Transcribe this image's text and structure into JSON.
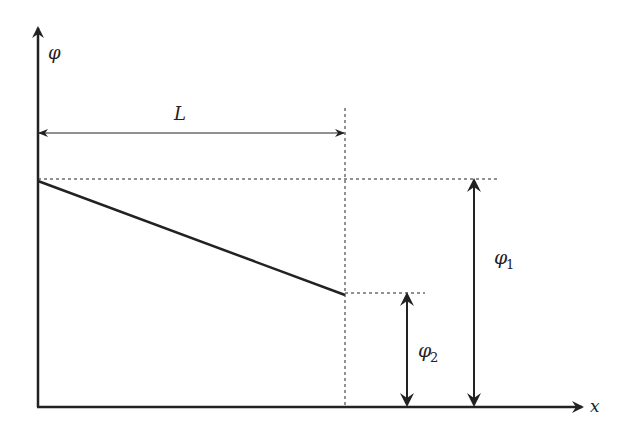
{
  "diagram": {
    "title": "",
    "colors": {
      "stroke": "#222222",
      "background": "#ffffff"
    },
    "axes": {
      "x_label": "x",
      "y_label": "φ"
    },
    "dimensions": {
      "length_label": "L",
      "phi1_label": {
        "symbol": "φ",
        "subscript": "1"
      },
      "phi2_label": {
        "symbol": "φ",
        "subscript": "2"
      }
    },
    "line": {
      "start": {
        "x": 0,
        "value": "φ1"
      },
      "end": {
        "x": "L",
        "value": "φ2"
      },
      "description": "Linear decrease of φ from φ1 at x=0 to φ2 at x=L"
    }
  }
}
